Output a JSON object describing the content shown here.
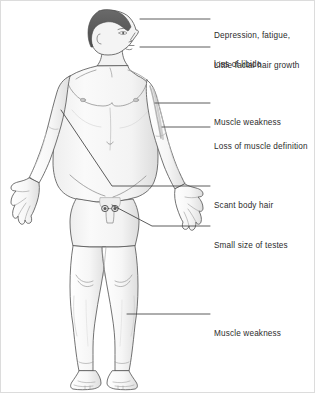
{
  "figure": {
    "colors": {
      "skin_fill": "#f4f4f4",
      "skin_shade": "#e2e2e2",
      "outline": "#5a5a5a",
      "hair": "#5c5c5c",
      "leader_line": "#4a4a4a",
      "text": "#2c2c2c",
      "border": "#d8d8d8",
      "background": "#ffffff"
    }
  },
  "annotations": [
    {
      "id": "depression-fatigue-libido",
      "line1": "Depression, fatigue,",
      "line2": "loss of libido",
      "text_x": 214,
      "text_y": 12,
      "leader": {
        "x1": 140,
        "y1": 19,
        "x2": 210,
        "y2": 19
      }
    },
    {
      "id": "little-facial-hair-growth",
      "line1": "Little facial hair growth",
      "line2": "",
      "text_x": 214,
      "text_y": 42,
      "leader": {
        "x1": 140,
        "y1": 47,
        "x2": 210,
        "y2": 47
      }
    },
    {
      "id": "muscle-weakness-arm",
      "line1": "Muscle weakness",
      "line2": "",
      "text_x": 214,
      "text_y": 99,
      "leader": {
        "x1": 155,
        "y1": 103,
        "x2": 210,
        "y2": 103
      }
    },
    {
      "id": "loss-of-muscle-definition",
      "line1": "Loss of muscle definition",
      "line2": "",
      "text_x": 214,
      "text_y": 123,
      "leader": {
        "x1": 162,
        "y1": 127,
        "x2": 210,
        "y2": 127
      }
    },
    {
      "id": "scant-body-hair",
      "line1": "Scant body hair",
      "line2": "",
      "text_x": 214,
      "text_y": 182,
      "leader": {
        "x1": 110,
        "y1": 186,
        "x2": 210,
        "y2": 186
      }
    },
    {
      "id": "small-size-of-testes",
      "line1": "Small size of testes",
      "line2": "",
      "text_x": 214,
      "text_y": 222,
      "leader": {
        "x1": 152,
        "y1": 226,
        "x2": 210,
        "y2": 226
      }
    },
    {
      "id": "muscle-weakness-leg",
      "line1": "Muscle weakness",
      "line2": "",
      "text_x": 214,
      "text_y": 310,
      "leader": {
        "x1": 127,
        "y1": 314,
        "x2": 210,
        "y2": 314
      }
    }
  ],
  "body_markers": {
    "testis_left_label": "left testis",
    "testis_right_label": "right testis",
    "chest_to_groin_line": "diagonal pointer from chest to pubic region"
  }
}
